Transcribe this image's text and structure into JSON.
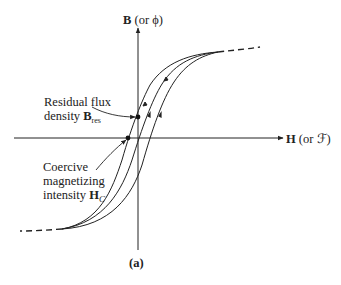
{
  "figure": {
    "caption": "(a)",
    "y_axis": {
      "symbol": "B",
      "alt": "(or ϕ)"
    },
    "x_axis": {
      "symbol": "H",
      "alt": "(or ℱ)"
    },
    "annotations": {
      "residual": {
        "line1": "Residual flux",
        "line2_text": "density ",
        "symbol": "B",
        "subscript": "res"
      },
      "coercive": {
        "line1": "Coercive",
        "line2": "magnetizing",
        "line3_text": "intensity ",
        "symbol": "H",
        "subscript": "C"
      }
    },
    "colors": {
      "stroke": "#222222",
      "background": "#ffffff"
    }
  }
}
